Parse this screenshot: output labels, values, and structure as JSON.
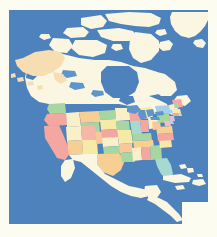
{
  "figure": {
    "kind": "map-image",
    "name": "north-america-political-map",
    "title": "",
    "caption": "",
    "projection_hint": "conic",
    "width_px": 217,
    "height_px": 237
  },
  "canvas": {
    "page_background": "#ffffff",
    "margin_color": "#fdfcf0",
    "margin_px": {
      "left": 9,
      "top": 10,
      "right": 9,
      "bottom": 13
    },
    "map_area_px": {
      "x": 9,
      "y": 10,
      "width": 199,
      "height": 214
    }
  },
  "palette": {
    "ocean": "#4d82bc",
    "ocean_shadow": "#5b8cc4",
    "land_neutral": "#fbf6e2",
    "land_neutral_light": "#fdfbf0",
    "alaska_tan": "#f6ddb2",
    "lake_blue": "#5f95cd",
    "coast_line": "#e9e3cc",
    "state_pink": "#f4a7a0",
    "state_salmon": "#f6b6a8",
    "state_green": "#a8d6a0",
    "state_green_deep": "#8fc98c",
    "state_yellow": "#f7e9a8",
    "state_cream": "#faf0c8",
    "state_orange": "#f8cf92",
    "state_peach": "#fac79c",
    "state_blue": "#a9cfe8",
    "state_teal": "#a6d9d0",
    "state_lilac": "#d6c3e2",
    "state_rose": "#f2bcc6"
  },
  "regions": [
    {
      "id": "greenland",
      "label": "Greenland",
      "fill": "land_neutral",
      "interactable": false
    },
    {
      "id": "canada",
      "label": "Canada",
      "fill": "land_neutral",
      "interactable": false
    },
    {
      "id": "canada-arctic-islands",
      "label": "Canadian Arctic Archipelago",
      "fill": "land_neutral",
      "interactable": false
    },
    {
      "id": "alaska",
      "label": "Alaska",
      "fill": "alaska_tan",
      "interactable": false
    },
    {
      "id": "united-states",
      "label": "United States",
      "fill": "multi",
      "interactable": false
    },
    {
      "id": "mexico",
      "label": "Mexico",
      "fill": "land_neutral",
      "interactable": false
    },
    {
      "id": "central-america",
      "label": "Central America",
      "fill": "land_neutral",
      "interactable": false
    },
    {
      "id": "cuba",
      "label": "Cuba",
      "fill": "land_neutral",
      "interactable": false
    },
    {
      "id": "hispaniola",
      "label": "Hispaniola",
      "fill": "land_neutral",
      "interactable": false
    },
    {
      "id": "bahamas",
      "label": "Bahamas",
      "fill": "land_neutral",
      "interactable": false
    },
    {
      "id": "south-america-tip",
      "label": "South America (northern tip)",
      "fill": "land_neutral",
      "interactable": false
    },
    {
      "id": "great-lakes",
      "label": "Great Lakes",
      "fill": "lake_blue",
      "interactable": false
    },
    {
      "id": "hudson-bay",
      "label": "Hudson Bay",
      "fill": "ocean",
      "interactable": false
    },
    {
      "id": "gulf-of-mexico",
      "label": "Gulf of Mexico",
      "fill": "ocean",
      "interactable": false
    },
    {
      "id": "pacific-ocean",
      "label": "Pacific Ocean",
      "fill": "ocean",
      "interactable": false
    },
    {
      "id": "atlantic-ocean",
      "label": "Atlantic Ocean",
      "fill": "ocean",
      "interactable": false
    },
    {
      "id": "arctic-ocean",
      "label": "Arctic Ocean",
      "fill": "ocean",
      "interactable": false
    }
  ],
  "us_states": [
    {
      "code": "WA",
      "name": "Washington",
      "fill": "state_green"
    },
    {
      "code": "OR",
      "name": "Oregon",
      "fill": "state_pink"
    },
    {
      "code": "CA",
      "name": "California",
      "fill": "state_pink"
    },
    {
      "code": "NV",
      "name": "Nevada",
      "fill": "state_cream"
    },
    {
      "code": "ID",
      "name": "Idaho",
      "fill": "state_cream"
    },
    {
      "code": "MT",
      "name": "Montana",
      "fill": "state_orange"
    },
    {
      "code": "WY",
      "name": "Wyoming",
      "fill": "state_green"
    },
    {
      "code": "UT",
      "name": "Utah",
      "fill": "state_salmon"
    },
    {
      "code": "AZ",
      "name": "Arizona",
      "fill": "state_orange"
    },
    {
      "code": "NM",
      "name": "New Mexico",
      "fill": "state_yellow"
    },
    {
      "code": "CO",
      "name": "Colorado",
      "fill": "state_peach"
    },
    {
      "code": "ND",
      "name": "North Dakota",
      "fill": "state_green"
    },
    {
      "code": "SD",
      "name": "South Dakota",
      "fill": "state_yellow"
    },
    {
      "code": "NE",
      "name": "Nebraska",
      "fill": "state_pink"
    },
    {
      "code": "KS",
      "name": "Kansas",
      "fill": "state_cream"
    },
    {
      "code": "OK",
      "name": "Oklahoma",
      "fill": "state_green"
    },
    {
      "code": "TX",
      "name": "Texas",
      "fill": "state_orange"
    },
    {
      "code": "MN",
      "name": "Minnesota",
      "fill": "state_cream"
    },
    {
      "code": "IA",
      "name": "Iowa",
      "fill": "state_green"
    },
    {
      "code": "MO",
      "name": "Missouri",
      "fill": "state_yellow"
    },
    {
      "code": "AR",
      "name": "Arkansas",
      "fill": "state_peach"
    },
    {
      "code": "LA",
      "name": "Louisiana",
      "fill": "state_green"
    },
    {
      "code": "WI",
      "name": "Wisconsin",
      "fill": "state_pink"
    },
    {
      "code": "IL",
      "name": "Illinois",
      "fill": "state_teal"
    },
    {
      "code": "MS",
      "name": "Mississippi",
      "fill": "state_cream"
    },
    {
      "code": "AL",
      "name": "Alabama",
      "fill": "state_pink"
    },
    {
      "code": "MI",
      "name": "Michigan",
      "fill": "state_yellow"
    },
    {
      "code": "IN",
      "name": "Indiana",
      "fill": "state_pink"
    },
    {
      "code": "OH",
      "name": "Ohio",
      "fill": "state_cream"
    },
    {
      "code": "KY",
      "name": "Kentucky",
      "fill": "state_green"
    },
    {
      "code": "TN",
      "name": "Tennessee",
      "fill": "state_orange"
    },
    {
      "code": "GA",
      "name": "Georgia",
      "fill": "state_green"
    },
    {
      "code": "FL",
      "name": "Florida",
      "fill": "state_teal"
    },
    {
      "code": "SC",
      "name": "South Carolina",
      "fill": "state_yellow"
    },
    {
      "code": "NC",
      "name": "North Carolina",
      "fill": "state_pink"
    },
    {
      "code": "VA",
      "name": "Virginia",
      "fill": "state_orange"
    },
    {
      "code": "WV",
      "name": "West Virginia",
      "fill": "state_peach"
    },
    {
      "code": "PA",
      "name": "Pennsylvania",
      "fill": "state_green"
    },
    {
      "code": "NY",
      "name": "New York",
      "fill": "state_blue"
    },
    {
      "code": "ME",
      "name": "Maine",
      "fill": "state_pink"
    },
    {
      "code": "VT",
      "name": "Vermont",
      "fill": "state_cream"
    },
    {
      "code": "NH",
      "name": "New Hampshire",
      "fill": "state_green"
    },
    {
      "code": "MA",
      "name": "Massachusetts",
      "fill": "state_yellow"
    },
    {
      "code": "CT",
      "name": "Connecticut",
      "fill": "state_pink"
    },
    {
      "code": "RI",
      "name": "Rhode Island",
      "fill": "state_orange"
    },
    {
      "code": "NJ",
      "name": "New Jersey",
      "fill": "state_lilac"
    },
    {
      "code": "DE",
      "name": "Delaware",
      "fill": "state_teal"
    },
    {
      "code": "MD",
      "name": "Maryland",
      "fill": "state_rose"
    }
  ],
  "labels": {
    "none_visible": ""
  }
}
